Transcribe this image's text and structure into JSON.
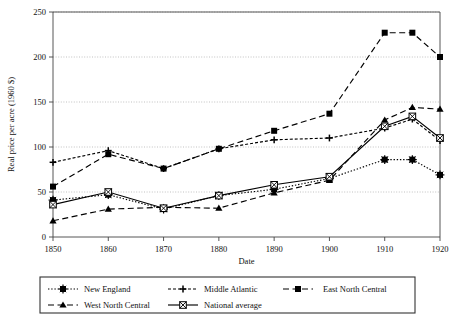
{
  "chart_data": {
    "type": "line",
    "title": "",
    "xlabel": "Date",
    "ylabel": "Real price per acre (1960 $)",
    "xlim": [
      1850,
      1920
    ],
    "ylim": [
      0,
      250
    ],
    "xticks": [
      1850,
      1860,
      1870,
      1880,
      1890,
      1900,
      1910,
      1920
    ],
    "yticks": [
      0,
      50,
      100,
      150,
      200,
      250
    ],
    "xtick_labels": [
      "1850",
      "1860",
      "1870",
      "1880",
      "1890",
      "1900",
      "1910",
      "1920"
    ],
    "ytick_labels": [
      "0",
      "50",
      "100",
      "150",
      "200",
      "250"
    ],
    "grid": "horizontal",
    "legend_position": "below",
    "x": [
      1850,
      1860,
      1870,
      1880,
      1890,
      1900,
      1910,
      1915,
      1920
    ],
    "series": [
      {
        "name": "New England",
        "marker": "star",
        "line": "dotted",
        "color": "#000000",
        "values": [
          41,
          47,
          31,
          46,
          53,
          65,
          86,
          86,
          69
        ]
      },
      {
        "name": "Middle Atlantic",
        "marker": "plus",
        "line": "dashed-fine",
        "color": "#000000",
        "values": [
          83,
          96,
          76,
          98,
          108,
          110,
          121,
          131,
          107
        ]
      },
      {
        "name": "East North Central",
        "marker": "square-filled",
        "line": "dashed-long",
        "color": "#000000",
        "values": [
          56,
          92,
          76,
          98,
          118,
          137,
          227,
          227,
          200
        ]
      },
      {
        "name": "West North Central",
        "marker": "triangle-filled",
        "line": "dashed-long",
        "color": "#000000",
        "values": [
          18,
          31,
          33,
          32,
          49,
          63,
          130,
          144,
          142
        ]
      },
      {
        "name": "National average",
        "marker": "square-star",
        "line": "solid",
        "color": "#000000",
        "values": [
          36,
          50,
          32,
          46,
          58,
          67,
          123,
          134,
          110
        ]
      }
    ]
  },
  "legend": {
    "items": [
      {
        "label": "New England"
      },
      {
        "label": "Middle Atlantic"
      },
      {
        "label": "East North Central"
      },
      {
        "label": "West North Central"
      },
      {
        "label": "National average"
      }
    ]
  }
}
